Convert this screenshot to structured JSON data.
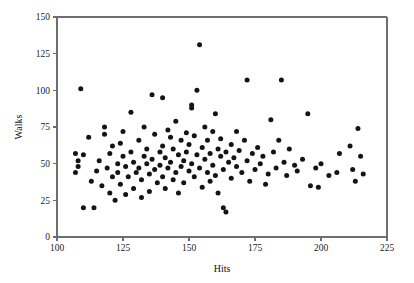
{
  "figure": {
    "width": 414,
    "height": 283,
    "background": "#ffffff",
    "point_color": "#141414",
    "axis_color": "#6e6e6e",
    "point_radius": 2.5
  },
  "chart_data": {
    "type": "scatter",
    "title": "",
    "xlabel": "Hits",
    "ylabel": "Walks",
    "xlim": [
      100,
      225
    ],
    "ylim": [
      0,
      150
    ],
    "xticks": [
      100,
      125,
      150,
      175,
      200,
      225
    ],
    "yticks": [
      0,
      25,
      50,
      75,
      100,
      125,
      150
    ],
    "xtick_labels": [
      "100",
      "125",
      "150",
      "175",
      "200",
      "225"
    ],
    "ytick_labels": [
      "0",
      "25",
      "50",
      "75",
      "100",
      "125",
      "150"
    ],
    "grid": false,
    "legend": null,
    "n_points": 148,
    "points": [
      [
        107,
        57
      ],
      [
        107,
        44
      ],
      [
        108,
        52
      ],
      [
        108,
        48
      ],
      [
        109,
        101
      ],
      [
        110,
        56
      ],
      [
        110,
        20
      ],
      [
        112,
        68
      ],
      [
        113,
        38
      ],
      [
        114,
        20
      ],
      [
        115,
        45
      ],
      [
        116,
        52
      ],
      [
        117,
        35
      ],
      [
        118,
        75
      ],
      [
        118,
        70
      ],
      [
        119,
        47
      ],
      [
        120,
        57
      ],
      [
        120,
        30
      ],
      [
        121,
        62
      ],
      [
        121,
        41
      ],
      [
        122,
        25
      ],
      [
        123,
        50
      ],
      [
        123,
        44
      ],
      [
        124,
        36
      ],
      [
        124,
        64
      ],
      [
        125,
        72
      ],
      [
        125,
        55
      ],
      [
        126,
        48
      ],
      [
        126,
        29
      ],
      [
        127,
        41
      ],
      [
        128,
        85
      ],
      [
        128,
        58
      ],
      [
        129,
        33
      ],
      [
        129,
        51
      ],
      [
        130,
        44
      ],
      [
        131,
        66
      ],
      [
        131,
        47
      ],
      [
        132,
        39
      ],
      [
        132,
        27
      ],
      [
        133,
        55
      ],
      [
        133,
        75
      ],
      [
        134,
        50
      ],
      [
        134,
        60
      ],
      [
        135,
        43
      ],
      [
        135,
        31
      ],
      [
        136,
        97
      ],
      [
        136,
        53
      ],
      [
        137,
        46
      ],
      [
        137,
        70
      ],
      [
        138,
        37
      ],
      [
        139,
        58
      ],
      [
        139,
        49
      ],
      [
        140,
        95
      ],
      [
        140,
        41
      ],
      [
        140,
        62
      ],
      [
        141,
        33
      ],
      [
        141,
        54
      ],
      [
        142,
        73
      ],
      [
        142,
        47
      ],
      [
        143,
        68
      ],
      [
        143,
        51
      ],
      [
        144,
        39
      ],
      [
        144,
        60
      ],
      [
        145,
        79
      ],
      [
        145,
        44
      ],
      [
        146,
        56
      ],
      [
        146,
        30
      ],
      [
        147,
        48
      ],
      [
        147,
        66
      ],
      [
        148,
        52
      ],
      [
        148,
        37
      ],
      [
        149,
        71
      ],
      [
        149,
        58
      ],
      [
        150,
        45
      ],
      [
        150,
        63
      ],
      [
        151,
        88
      ],
      [
        151,
        90
      ],
      [
        151,
        50
      ],
      [
        152,
        41
      ],
      [
        152,
        69
      ],
      [
        153,
        100
      ],
      [
        153,
        56
      ],
      [
        154,
        131
      ],
      [
        154,
        47
      ],
      [
        155,
        61
      ],
      [
        155,
        34
      ],
      [
        156,
        53
      ],
      [
        156,
        75
      ],
      [
        157,
        44
      ],
      [
        157,
        66
      ],
      [
        158,
        38
      ],
      [
        158,
        57
      ],
      [
        159,
        49
      ],
      [
        159,
        72
      ],
      [
        160,
        84
      ],
      [
        160,
        42
      ],
      [
        161,
        60
      ],
      [
        161,
        30
      ],
      [
        162,
        55
      ],
      [
        162,
        67
      ],
      [
        163,
        46
      ],
      [
        163,
        20
      ],
      [
        164,
        58
      ],
      [
        164,
        17
      ],
      [
        165,
        51
      ],
      [
        166,
        63
      ],
      [
        166,
        40
      ],
      [
        167,
        54
      ],
      [
        168,
        72
      ],
      [
        168,
        48
      ],
      [
        169,
        59
      ],
      [
        170,
        44
      ],
      [
        171,
        66
      ],
      [
        172,
        107
      ],
      [
        172,
        52
      ],
      [
        173,
        38
      ],
      [
        174,
        57
      ],
      [
        175,
        46
      ],
      [
        176,
        61
      ],
      [
        177,
        50
      ],
      [
        178,
        55
      ],
      [
        179,
        36
      ],
      [
        180,
        43
      ],
      [
        181,
        80
      ],
      [
        182,
        58
      ],
      [
        183,
        47
      ],
      [
        184,
        66
      ],
      [
        185,
        107
      ],
      [
        186,
        51
      ],
      [
        187,
        42
      ],
      [
        188,
        60
      ],
      [
        190,
        49
      ],
      [
        191,
        45
      ],
      [
        193,
        53
      ],
      [
        195,
        84
      ],
      [
        196,
        35
      ],
      [
        198,
        47
      ],
      [
        199,
        34
      ],
      [
        200,
        50
      ],
      [
        203,
        42
      ],
      [
        206,
        44
      ],
      [
        207,
        57
      ],
      [
        211,
        62
      ],
      [
        212,
        46
      ],
      [
        213,
        38
      ],
      [
        214,
        74
      ],
      [
        215,
        55
      ],
      [
        216,
        43
      ]
    ]
  }
}
